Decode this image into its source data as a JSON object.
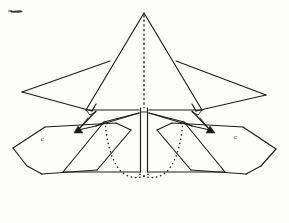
{
  "figure": {
    "drawing_type": "technical-line-drawing",
    "canvas": {
      "width": 289,
      "height": 223
    },
    "colors": {
      "background": "#fdfdfc",
      "line": "#1d1d1d",
      "dotted_line": "#242424",
      "fill_marker": "#1b1b1b"
    },
    "style": {
      "line_weight": "thin",
      "fill": "none",
      "symmetry": "bilateral-vertical"
    }
  },
  "annotations": {
    "left_wing_marker": "c",
    "right_wing_marker": "c",
    "left_nacelle_marker": "A",
    "right_nacelle_marker": "A"
  },
  "geometry": {
    "centerline_x": 144,
    "apex": {
      "x": 144,
      "y": 13
    },
    "apex_label": "nose apex",
    "left_wingtip": {
      "x": 22,
      "y": 92
    },
    "right_wingtip": {
      "x": 266,
      "y": 95
    },
    "main_triangle": {
      "name": "central delta body",
      "points": "144,13 86,110 202,110"
    },
    "upper_wing_left": {
      "name": "left forward swept panel",
      "points": "22,92 110,61 96,111"
    },
    "upper_wing_right": {
      "name": "right forward swept panel",
      "points": "266,95 176,61 192,111"
    },
    "lower_wing_left": {
      "name": "left outer folding panel",
      "points": "13,148 45,127 98,120 131,130 97,170 42,174"
    },
    "lower_wing_right": {
      "name": "right outer folding panel",
      "points": "276,149 243,127 190,120 157,130 191,170 246,174"
    },
    "bottom_chord_y": 172,
    "dotted_trace_left": "104,123 108,148 113,163 122,174 134,178 148,174",
    "dotted_trace_right": "184,123 180,148 175,163 166,174 154,178 140,174",
    "center_spine": {
      "top_y": 108,
      "bottom_y": 172,
      "left_x": 141,
      "right_x": 147
    }
  },
  "elements": [
    {
      "id": "main-delta",
      "label": "central delta body"
    },
    {
      "id": "upper-wing-left",
      "label": "left upper wing panel"
    },
    {
      "id": "upper-wing-right",
      "label": "right upper wing panel"
    },
    {
      "id": "lower-wing-left",
      "label": "left lower wing panel"
    },
    {
      "id": "lower-wing-right",
      "label": "right lower wing panel"
    },
    {
      "id": "center-spine",
      "label": "fuselage spine"
    },
    {
      "id": "centerline",
      "label": "vertical axis of symmetry"
    },
    {
      "id": "dotted-trace-left",
      "label": "left hidden outline"
    },
    {
      "id": "dotted-trace-right",
      "label": "right hidden outline"
    },
    {
      "id": "bottom-chord",
      "label": "trailing edge chord line"
    }
  ]
}
